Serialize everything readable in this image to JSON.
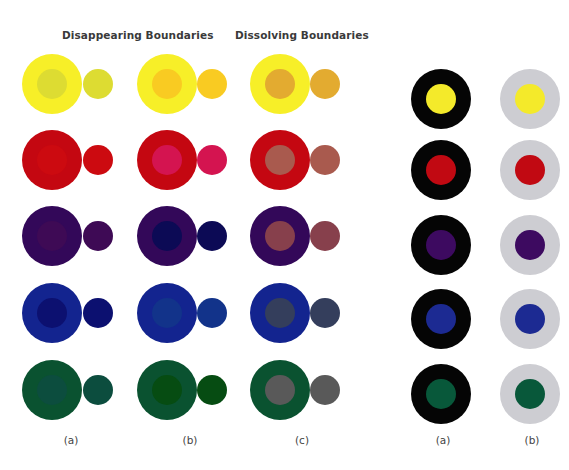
{
  "headings": {
    "disappearing": "Disappearing Boundaries",
    "dissolving": "Dissolving Boundaries"
  },
  "left_figure": {
    "column_labels": [
      "(a)",
      "(b)",
      "(c)"
    ],
    "rows": [
      {
        "name": "yellow",
        "surround": "#f7ef28",
        "a": "#dddc32",
        "b": "#f9cb22",
        "c": "#e3ab30"
      },
      {
        "name": "red",
        "surround": "#c40711",
        "a": "#cc0a10",
        "b": "#d41450",
        "c": "#a95a4e"
      },
      {
        "name": "purple",
        "surround": "#330859",
        "a": "#3e0a55",
        "b": "#0c0a55",
        "c": "#87404c"
      },
      {
        "name": "blue",
        "surround": "#13248f",
        "a": "#0c1070",
        "b": "#12338a",
        "c": "#343e5c"
      },
      {
        "name": "green",
        "surround": "#0a5230",
        "a": "#0c4d3e",
        "b": "#064c12",
        "c": "#595959"
      }
    ]
  },
  "right_figure": {
    "column_labels": [
      "(a)",
      "(b)"
    ],
    "surrounds": {
      "a": "#050505",
      "b": "#cdcdd2"
    },
    "centers": [
      "#f4ea2a",
      "#c10912",
      "#3d0a60",
      "#1c2a92",
      "#08583a"
    ]
  }
}
